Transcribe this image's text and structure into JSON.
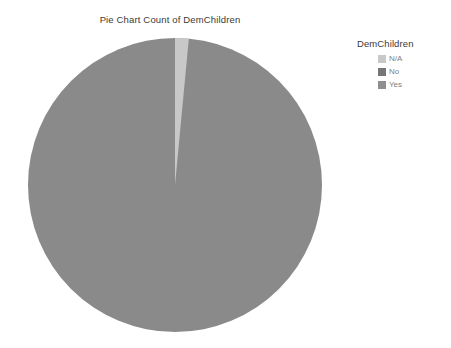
{
  "chart_data": {
    "type": "pie",
    "title": "Pie Chart Count of DemChildren",
    "categories": [
      "N/A",
      "No",
      "Yes"
    ],
    "values": [
      1.5,
      98.5,
      0.0
    ],
    "unit": "percent",
    "colors": [
      "#c8c8c8",
      "#8a8a8a",
      "#9a9a9a"
    ],
    "legend_title": "DemChildren",
    "legend_position": "right",
    "start_angle_deg": -90,
    "grid": false,
    "xlabel": "",
    "ylabel": "",
    "background": "#ffffff",
    "geometry": {
      "center_x": 175,
      "center_y": 185,
      "radius": 147
    }
  },
  "legend": {
    "title": "DemChildren",
    "items": [
      {
        "label": "N/A",
        "color": "#c8c8c8"
      },
      {
        "label": "No",
        "color": "#767676"
      },
      {
        "label": "Yes",
        "color": "#8f8f8f"
      }
    ]
  },
  "slices": [
    {
      "label": "N/A",
      "color": "#c8c8c8"
    },
    {
      "label": "No",
      "color": "#8a8a8a"
    },
    {
      "label": "Yes",
      "color": "#9a9a9a"
    }
  ]
}
